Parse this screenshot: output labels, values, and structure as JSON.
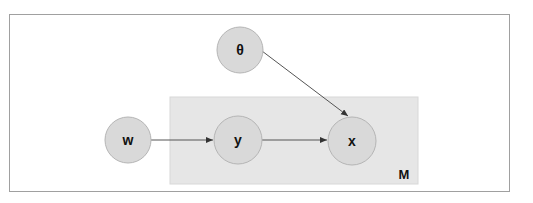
{
  "diagram": {
    "type": "graphical-model",
    "plate": {
      "label": "M",
      "fill": "#e6e6e6",
      "x": 170,
      "y": 97,
      "width": 248,
      "height": 87
    },
    "node_style": {
      "fill": "#d9d9d9",
      "stroke": "#b5b5b5"
    },
    "nodes": [
      {
        "id": "theta",
        "label": "θ",
        "cx": 240,
        "cy": 50,
        "r": 23
      },
      {
        "id": "w",
        "label": "w",
        "cx": 128,
        "cy": 140,
        "r": 23
      },
      {
        "id": "y",
        "label": "y",
        "cx": 238,
        "cy": 140,
        "r": 24
      },
      {
        "id": "x",
        "label": "x",
        "cx": 352,
        "cy": 141,
        "r": 24
      }
    ],
    "edges": [
      {
        "from": "w",
        "to": "y"
      },
      {
        "from": "y",
        "to": "x"
      },
      {
        "from": "theta",
        "to": "x"
      }
    ]
  }
}
